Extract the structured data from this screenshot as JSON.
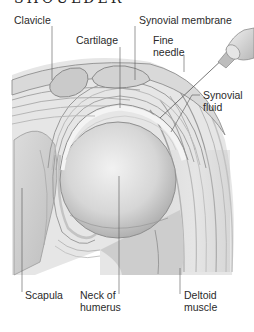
{
  "title": "SHOULDER",
  "labels": {
    "clavicle": "Clavicle",
    "cartilage": "Cartilage",
    "synovial_membrane": "Synovial membrane",
    "fine_needle_l1": "Fine",
    "fine_needle_l2": "needle",
    "synovial_fluid_l1": "Synovial",
    "synovial_fluid_l2": "fluid",
    "scapula": "Scapula",
    "neck_of_humerus_l1": "Neck of",
    "neck_of_humerus_l2": "humerus",
    "deltoid_l1": "Deltoid",
    "deltoid_l2": "muscle"
  },
  "colors": {
    "ink": "#2a2a2a",
    "shade_dark": "#8a8a8a",
    "shade_mid": "#bdbdbd",
    "shade_light": "#e2e2e2"
  }
}
